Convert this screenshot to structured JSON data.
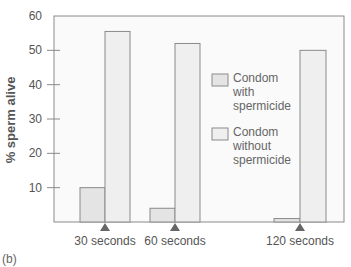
{
  "chart_data": {
    "type": "bar",
    "title": "",
    "panel_label": "(b)",
    "xlabel": "",
    "ylabel": "% sperm alive",
    "ylim": [
      0,
      60
    ],
    "yticks": [
      10,
      20,
      30,
      40,
      50,
      60
    ],
    "grid": false,
    "legend_position": "right-inside",
    "categories": [
      "30 seconds",
      "60 seconds",
      "120 seconds"
    ],
    "series": [
      {
        "name": "Condom with spermicide",
        "color": "#e4e4e4",
        "values": [
          10,
          4,
          1
        ]
      },
      {
        "name": "Condom without spermicide",
        "color": "#efefef",
        "values": [
          55.5,
          52,
          50
        ]
      }
    ]
  },
  "legend": {
    "items": [
      {
        "lines": [
          "Condom",
          "with",
          "spermicide"
        ]
      },
      {
        "lines": [
          "Condom",
          "without",
          "spermicide"
        ]
      }
    ]
  },
  "colors": {
    "frame": "#8a8a8a",
    "plot_bg": "#fafafa",
    "marker": "#666666",
    "text": "#555555"
  }
}
